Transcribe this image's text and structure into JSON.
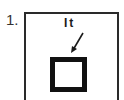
{
  "figure": {
    "number": "1.",
    "label": "It",
    "elements": {
      "outer_frame": "rectangle",
      "inner_square": "thick-bordered square",
      "arrow": "pointing from label to inner square"
    },
    "colors": {
      "line": "#2a2a2a",
      "fill": "#ffffff"
    }
  }
}
